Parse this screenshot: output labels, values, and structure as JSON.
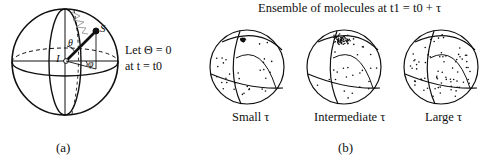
{
  "panel_a": {
    "caption": "(a)",
    "note_line1": "Let Θ = 0",
    "note_line2": "at t = t0",
    "labels": {
      "origin": "I",
      "spin": "S",
      "theta": "θ",
      "phi": "φ"
    }
  },
  "panel_b": {
    "caption": "(b)",
    "title": "Ensemble of molecules at t1 = t0 + τ",
    "spheres": [
      {
        "label": "Small τ",
        "spread": "small"
      },
      {
        "label": "Intermediate τ",
        "spread": "intermediate"
      },
      {
        "label": "Large τ",
        "spread": "large"
      }
    ]
  },
  "colors": {
    "line": "#111111",
    "background": "#ffffff"
  }
}
